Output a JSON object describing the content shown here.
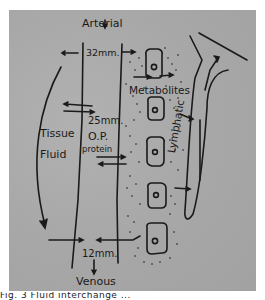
{
  "figure": {
    "labels": {
      "arterial": "Arterial",
      "arterial_pressure": "32mm.",
      "metabolites": "Metabolites",
      "op_pressure": "25mm.",
      "op_label": "O.P.",
      "protein": "protein",
      "tissue": "Tissue",
      "fluid": "Fluid",
      "lymphatic": "Lymphatic",
      "venous_pressure": "12mm.",
      "venous": "Venous"
    },
    "caption": "Fig. 3  Fluid interchange ..."
  },
  "colors": {
    "background": "#a9a9a9",
    "ink": "#1a1a1a",
    "page": "#ffffff"
  }
}
